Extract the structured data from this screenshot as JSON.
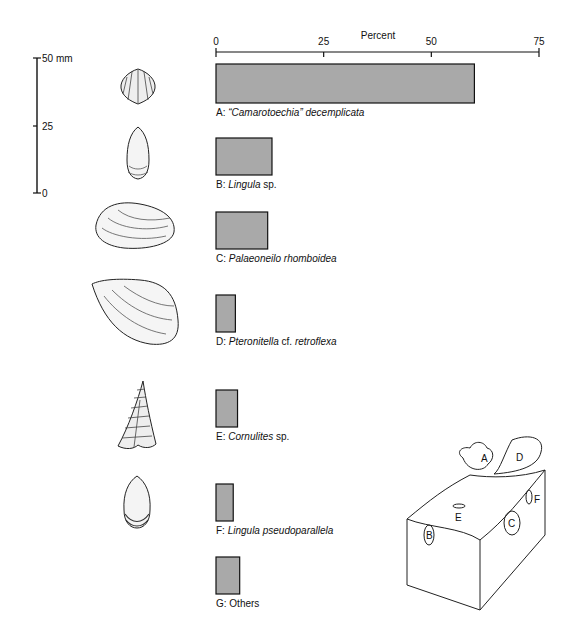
{
  "scale_bar": {
    "unit_label": "50 mm",
    "ticks": [
      "50 mm",
      "25",
      "0"
    ]
  },
  "chart_data": {
    "type": "bar",
    "orientation": "horizontal",
    "title": "",
    "xlabel": "Percent",
    "ylabel": "",
    "xlim": [
      0,
      75
    ],
    "xticks": [
      "0",
      "25",
      "50",
      "75"
    ],
    "xtick_values": [
      0,
      25,
      50,
      75
    ],
    "axis_position": "top",
    "grid": false,
    "bar_color": "#a9a9a9",
    "categories": [
      {
        "letter": "A:",
        "name": "“Camarotoechia” decemplicata",
        "parts": [
          {
            "t": "“Camarotoechia”",
            "i": true
          },
          {
            "t": " decemplicata",
            "i": true
          }
        ]
      },
      {
        "letter": "B:",
        "name": "Lingula sp.",
        "parts": [
          {
            "t": "Lingula",
            "i": true
          },
          {
            "t": " sp.",
            "i": false
          }
        ]
      },
      {
        "letter": "C:",
        "name": "Palaeoneilo rhomboidea",
        "parts": [
          {
            "t": "Palaeoneilo rhomboidea",
            "i": true
          }
        ]
      },
      {
        "letter": "D:",
        "name": "Pteronitella cf. retroflexa",
        "parts": [
          {
            "t": "Pteronitella",
            "i": true
          },
          {
            "t": " cf. ",
            "i": false
          },
          {
            "t": "retroflexa",
            "i": true
          }
        ]
      },
      {
        "letter": "E:",
        "name": "Cornulites sp.",
        "parts": [
          {
            "t": "Cornulites",
            "i": true
          },
          {
            "t": " sp.",
            "i": false
          }
        ]
      },
      {
        "letter": "F:",
        "name": "Lingula pseudoparallela",
        "parts": [
          {
            "t": "Lingula pseudoparallela",
            "i": true
          }
        ]
      },
      {
        "letter": "G:",
        "name": "Others",
        "parts": [
          {
            "t": "Others",
            "i": false
          }
        ]
      }
    ],
    "values": [
      60,
      13,
      12,
      4.5,
      5,
      4,
      5.5
    ]
  },
  "block_diagram": {
    "labels": [
      "A",
      "D",
      "F",
      "E",
      "C",
      "B"
    ]
  }
}
